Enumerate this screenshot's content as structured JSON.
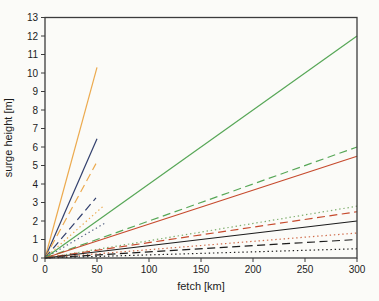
{
  "figure": {
    "background": "#fbfbf8",
    "frame_color": "#3c3c3c",
    "text_color": "#1c1c1c"
  },
  "chart_data": {
    "type": "line",
    "title": "",
    "xlabel": "fetch [km]",
    "ylabel": "surge height [m]",
    "xlim": [
      0,
      300
    ],
    "ylim": [
      0,
      13
    ],
    "x_ticks": [
      0,
      50,
      100,
      150,
      200,
      250,
      300
    ],
    "y_ticks": [
      0,
      1,
      2,
      3,
      4,
      5,
      6,
      7,
      8,
      9,
      10,
      11,
      12,
      13
    ],
    "grid": false,
    "legend": "none",
    "series": [
      {
        "name": "orange-solid",
        "color": "#ecaa4e",
        "style": "solid",
        "points": [
          [
            0,
            0
          ],
          [
            50,
            10.3
          ]
        ]
      },
      {
        "name": "blue-solid",
        "color": "#32406d",
        "style": "solid",
        "points": [
          [
            0,
            0
          ],
          [
            50,
            6.45
          ]
        ]
      },
      {
        "name": "orange-dashed",
        "color": "#ecaa4e",
        "style": "dashed",
        "points": [
          [
            0,
            0
          ],
          [
            49,
            5.1
          ]
        ]
      },
      {
        "name": "blue-dashed",
        "color": "#32406d",
        "style": "dashed",
        "points": [
          [
            0,
            0
          ],
          [
            49,
            3.25
          ]
        ]
      },
      {
        "name": "orange-dotted",
        "color": "#ecaa4e",
        "style": "dotted",
        "points": [
          [
            0,
            0
          ],
          [
            57,
            2.85
          ]
        ]
      },
      {
        "name": "blue-dotted",
        "color": "#5a6788",
        "style": "dotted",
        "points": [
          [
            0,
            0
          ],
          [
            58,
            1.9
          ]
        ]
      },
      {
        "name": "green-solid",
        "color": "#57a757",
        "style": "solid",
        "points": [
          [
            0,
            0
          ],
          [
            300,
            12.0
          ]
        ]
      },
      {
        "name": "green-dashed",
        "color": "#57a757",
        "style": "dashed",
        "points": [
          [
            0,
            0
          ],
          [
            300,
            6.0
          ]
        ]
      },
      {
        "name": "red-solid",
        "color": "#c64a2d",
        "style": "solid",
        "points": [
          [
            0,
            0
          ],
          [
            300,
            5.5
          ]
        ]
      },
      {
        "name": "green-dotted",
        "color": "#7fae6e",
        "style": "dotted",
        "points": [
          [
            0,
            0
          ],
          [
            300,
            2.8
          ]
        ]
      },
      {
        "name": "red-dashed",
        "color": "#c64a2d",
        "style": "dashed",
        "points": [
          [
            0,
            0
          ],
          [
            300,
            2.5
          ]
        ]
      },
      {
        "name": "black-solid",
        "color": "#1c1c1c",
        "style": "solid",
        "points": [
          [
            0,
            0
          ],
          [
            300,
            2.0
          ]
        ]
      },
      {
        "name": "red-dotted",
        "color": "#cf6b49",
        "style": "dotted",
        "points": [
          [
            0,
            0
          ],
          [
            300,
            1.35
          ]
        ]
      },
      {
        "name": "black-dashed",
        "color": "#1c1c1c",
        "style": "dashed",
        "points": [
          [
            0,
            0
          ],
          [
            300,
            1.0
          ]
        ]
      },
      {
        "name": "black-dotted",
        "color": "#1c1c1c",
        "style": "dotted",
        "points": [
          [
            0,
            0
          ],
          [
            300,
            0.5
          ]
        ]
      }
    ]
  }
}
